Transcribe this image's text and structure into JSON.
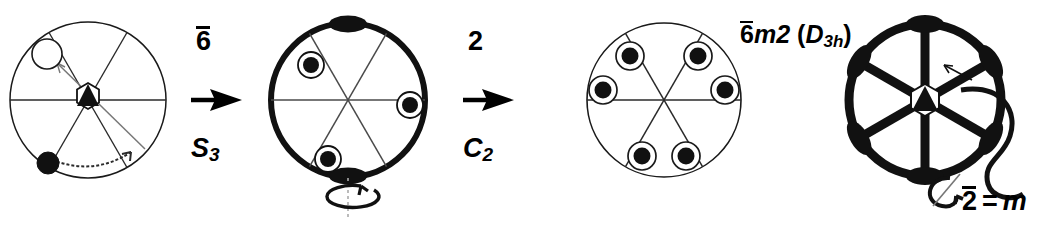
{
  "figure": {
    "type": "crystallographic-point-group-derivation",
    "background_color": "#ffffff",
    "ink_color": "#000000",
    "panel_count": 4,
    "width": 1053,
    "height": 228
  },
  "steps": [
    {
      "id": "step-1",
      "top_label": "6",
      "top_label_overbar": true,
      "top_label_reading": "6-bar",
      "bottom_label": "S",
      "bottom_label_sub": "3",
      "bottom_label_reading": "S3",
      "arrow": "right-arrow"
    },
    {
      "id": "step-2",
      "top_label": "2",
      "top_label_overbar": false,
      "top_label_reading": "2",
      "bottom_label": "C",
      "bottom_label_sub": "2",
      "bottom_label_reading": "C2",
      "arrow": "right-arrow"
    }
  ],
  "point_group": {
    "hm_symbol_prefix": "6",
    "hm_symbol_overbar": true,
    "hm_symbol_rest": "m2",
    "schoenflies_open": "(",
    "schoenflies_letter": "D",
    "schoenflies_sub": "3h",
    "schoenflies_close": ")",
    "full_text": "6̄m2 (D3h)"
  },
  "mirror_note": {
    "symbol": "2",
    "overbar": true,
    "equals": "=",
    "mirror": "m",
    "full_text": "2̄ = m",
    "rotation_glyph": "rotation-arrow"
  },
  "diagrams": [
    {
      "id": "diagram-1",
      "name": "general-position-with-6bar-axis",
      "cx": 88,
      "cy": 100,
      "r": 78,
      "rim_weight": "thin",
      "spoke_weight": "thin",
      "spoke_count": 3,
      "spoke_angles_deg": [
        0,
        60,
        120
      ],
      "center_symbol": "6bar-triangle-in-hexagon",
      "points": [
        {
          "kind": "open-circle",
          "angle_deg": 132,
          "radius_frac": 0.6,
          "size": 22
        },
        {
          "kind": "filled-circle",
          "angle_deg": 215,
          "radius_frac": 0.62,
          "size": 19
        }
      ],
      "arrows": [
        {
          "kind": "thin-straight-arrow",
          "from_angle_deg": 320,
          "to_angle_deg": 132
        },
        {
          "kind": "thin-curved-arrow",
          "from_angle_deg": 215,
          "to_angle_deg": 300
        }
      ],
      "rim_markers": []
    },
    {
      "id": "diagram-2",
      "name": "6bar-orbit-three-points",
      "cx": 348,
      "cy": 100,
      "r": 77,
      "rim_weight": "thick",
      "spoke_weight": "thin",
      "spoke_count": 3,
      "spoke_angles_deg": [
        0,
        60,
        120
      ],
      "center_symbol": "none",
      "points": [
        {
          "kind": "ringed-filled-circle",
          "angle_deg": 137,
          "radius_frac": 0.66,
          "size": 24
        },
        {
          "kind": "ringed-filled-circle",
          "angle_deg": 355,
          "radius_frac": 0.8,
          "size": 24
        },
        {
          "kind": "ringed-filled-circle",
          "angle_deg": 249,
          "radius_frac": 0.72,
          "size": 24
        }
      ],
      "arrows": [],
      "rim_markers": [
        {
          "kind": "two-fold-lens",
          "angle_deg": 90
        },
        {
          "kind": "two-fold-lens",
          "angle_deg": 270
        }
      ],
      "rotation_axis": {
        "kind": "vertical-dotted-axis",
        "arrow": "ellipse-rotation-arrow"
      }
    },
    {
      "id": "diagram-3",
      "name": "6bar-m2-orbit-six-points",
      "cx": 664,
      "cy": 100,
      "r": 77,
      "rim_weight": "thin",
      "spoke_weight": "thin",
      "spoke_count": 3,
      "spoke_angles_deg": [
        0,
        60,
        120
      ],
      "center_symbol": "none",
      "points": [
        {
          "kind": "ringed-filled-circle",
          "angle_deg": 127,
          "radius_frac": 0.72,
          "size": 24
        },
        {
          "kind": "ringed-filled-circle",
          "angle_deg": 171,
          "radius_frac": 0.8,
          "size": 24
        },
        {
          "kind": "ringed-filled-circle",
          "angle_deg": 53,
          "radius_frac": 0.72,
          "size": 24
        },
        {
          "kind": "ringed-filled-circle",
          "angle_deg": 9,
          "radius_frac": 0.8,
          "size": 24
        },
        {
          "kind": "ringed-filled-circle",
          "angle_deg": 249,
          "radius_frac": 0.78,
          "size": 24
        },
        {
          "kind": "ringed-filled-circle",
          "angle_deg": 291,
          "radius_frac": 0.78,
          "size": 24
        }
      ],
      "arrows": [],
      "rim_markers": []
    },
    {
      "id": "diagram-4",
      "name": "symmetry-element-diagram-6bar-m2",
      "cx": 925,
      "cy": 100,
      "r": 76,
      "rim_weight": "thick",
      "spoke_weight": "thick",
      "spoke_count": 3,
      "spoke_angles_deg": [
        90,
        30,
        150
      ],
      "center_symbol": "6bar-triangle-in-hexagon",
      "points": [],
      "rim_markers": [
        {
          "kind": "two-fold-lens",
          "angle_deg": 90
        },
        {
          "kind": "two-fold-lens",
          "angle_deg": 30
        },
        {
          "kind": "two-fold-lens",
          "angle_deg": 330
        },
        {
          "kind": "two-fold-lens",
          "angle_deg": 270
        },
        {
          "kind": "two-fold-lens",
          "angle_deg": 210
        },
        {
          "kind": "two-fold-lens",
          "angle_deg": 150
        }
      ],
      "callout": {
        "kind": "s-curve-leader-with-arrow",
        "points_at_angle_deg": 20
      }
    }
  ],
  "layout": {
    "step1_top_left": 196,
    "step1_top_top": 28,
    "step1_arrow_left": 190,
    "step1_arrow_top": 86,
    "step1_bot_left": 191,
    "step1_bot_top": 135,
    "step2_top_left": 468,
    "step2_top_top": 28,
    "step2_arrow_left": 462,
    "step2_arrow_top": 86,
    "step2_bot_left": 463,
    "step2_bot_top": 135,
    "hm_left": 740,
    "hm_top": 22,
    "eqm_left": 962,
    "eqm_top": 188
  }
}
